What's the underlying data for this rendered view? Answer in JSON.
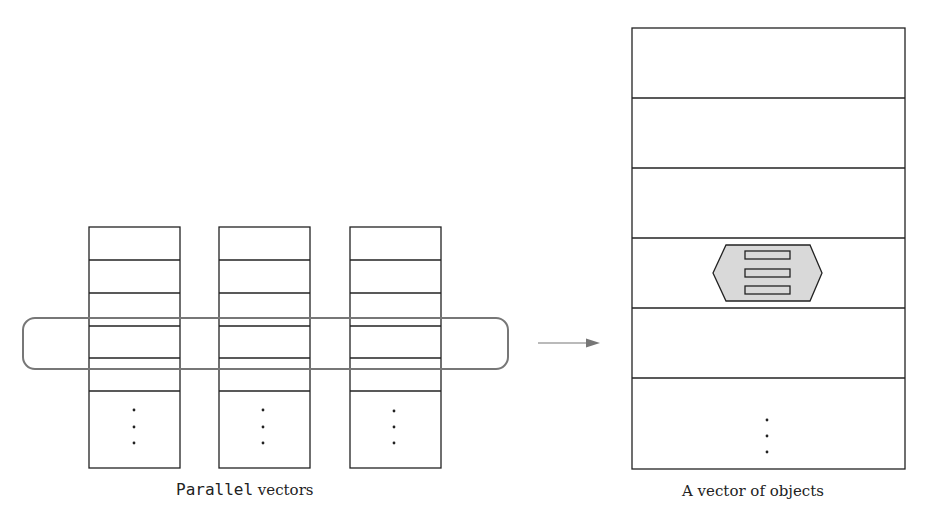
{
  "left_diagram": {
    "caption_code": "Parallel",
    "caption_text": " vectors",
    "columns": 3,
    "rows_per_column": 6,
    "ellipsis": "⋮"
  },
  "right_diagram": {
    "caption": "A vector of objects",
    "rows": 6,
    "object_icon": "hexagon-object-icon",
    "object_fields": 3
  },
  "arrow": {
    "direction": "right"
  },
  "colors": {
    "stroke": "#222222",
    "highlight_stroke": "#777777",
    "object_fill": "#d9d9d9",
    "arrow": "#777777"
  }
}
